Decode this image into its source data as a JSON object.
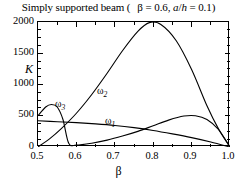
{
  "title": {
    "text_main": "Simply supported beam (",
    "param1": "β = 0.6,",
    "param2_num": "a",
    "param2_slash": "/",
    "param2_den": "h",
    "param2_val": " = 0.1)",
    "full": "Simply supported beam ( β = 0.6, a/h = 0.1)"
  },
  "axes": {
    "y_title": "K",
    "x_title": "β",
    "y_ticks": [
      "0",
      "500",
      "1000",
      "1500",
      "2000"
    ],
    "x_ticks": [
      "0.5",
      "0.6",
      "0.7",
      "0.8",
      "0.9",
      "1.0"
    ]
  },
  "labels": {
    "omega1_base": "ω",
    "omega1_sub": "1",
    "omega2_base": "ω",
    "omega2_sub": "2",
    "omega3_base": "ω",
    "omega3_sub": "3"
  },
  "colors": {
    "curve": "#000000",
    "frame": "#000000",
    "background": "#ffffff"
  },
  "chart_data": {
    "type": "line",
    "xlabel": "β",
    "ylabel": "K",
    "xlim": [
      0.5,
      1.0
    ],
    "ylim": [
      0,
      2000
    ],
    "x_ticks": [
      0.5,
      0.6,
      0.7,
      0.8,
      0.9,
      1.0
    ],
    "y_ticks": [
      0,
      500,
      1000,
      1500,
      2000
    ],
    "x_minor_step": 0.05,
    "y_minor_step": 125,
    "grid": false,
    "legend": "inline-annotations",
    "series": [
      {
        "name": "ω1",
        "label": "ω₁",
        "label_position": [
          0.68,
          440
        ],
        "x": [
          0.5,
          0.55,
          0.6,
          0.65,
          0.7,
          0.75,
          0.8,
          0.85,
          0.9,
          0.95,
          1.0
        ],
        "y": [
          420,
          405,
          390,
          370,
          345,
          310,
          265,
          210,
          150,
          80,
          0
        ]
      },
      {
        "name": "ω2",
        "label": "ω₂",
        "label_position": [
          0.665,
          880
        ],
        "x": [
          0.5,
          0.53,
          0.56,
          0.6,
          0.64,
          0.68,
          0.72,
          0.76,
          0.79,
          0.82,
          0.86,
          0.9,
          0.94,
          0.97,
          1.0
        ],
        "y": [
          0,
          130,
          290,
          540,
          840,
          1180,
          1540,
          1850,
          1990,
          1960,
          1700,
          1240,
          660,
          290,
          0
        ]
      },
      {
        "name": "ω3",
        "label": "ω₃",
        "label_position": [
          0.555,
          630
        ],
        "x": [
          0.5,
          0.52,
          0.535,
          0.55,
          0.565,
          0.58,
          0.6,
          0.64,
          0.68,
          0.72,
          0.76,
          0.8,
          0.84,
          0.88,
          0.91,
          0.94,
          0.97,
          1.0
        ],
        "y": [
          500,
          640,
          680,
          640,
          440,
          60,
          30,
          60,
          110,
          175,
          250,
          340,
          430,
          495,
          500,
          440,
          280,
          0
        ]
      }
    ]
  }
}
